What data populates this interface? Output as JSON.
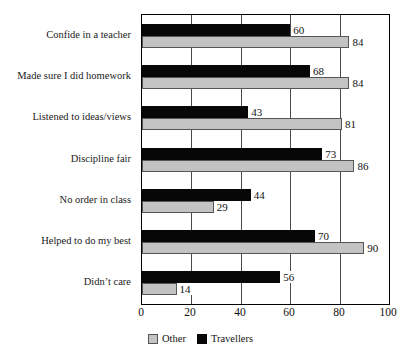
{
  "chart_data": {
    "type": "bar",
    "orientation": "horizontal",
    "title": "",
    "xlabel": "",
    "ylabel": "",
    "xlim": [
      0,
      100
    ],
    "xticks": [
      0,
      20,
      40,
      60,
      80,
      100
    ],
    "grid": true,
    "legend_position": "bottom",
    "categories": [
      "Confide in a teacher",
      "Made sure I did homework",
      "Listened to ideas/views",
      "Discipline fair",
      "No order in class",
      "Helped to do my best",
      "Didn’t care"
    ],
    "series": [
      {
        "name": "Travellers",
        "color": "#070707",
        "values": [
          60,
          68,
          43,
          73,
          44,
          70,
          56
        ]
      },
      {
        "name": "Other",
        "color": "#c3c3c3",
        "values": [
          84,
          84,
          81,
          86,
          29,
          90,
          14
        ]
      }
    ]
  },
  "legend": {
    "items": [
      {
        "label": "Other",
        "swatch": "other"
      },
      {
        "label": "Travellers",
        "swatch": "travellers"
      }
    ]
  }
}
